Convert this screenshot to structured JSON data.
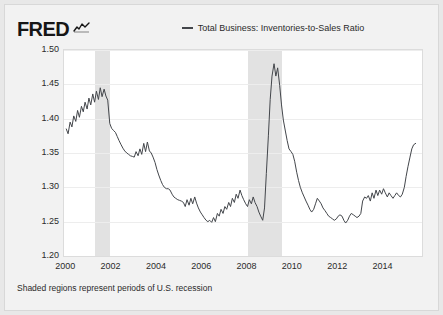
{
  "brand": {
    "wordmark": "FRED",
    "squiggle_icon": "fred-squiggle-icon"
  },
  "legend": {
    "position": "top-center",
    "entries": [
      {
        "label": "Total Business: Inventories-to-Sales Ratio",
        "color": "#43464b"
      }
    ]
  },
  "footnote": "Shaded regions represent periods of U.S. recession",
  "axes": {
    "y_title": "(Ratio)",
    "y_ticks": [
      "1.50",
      "1.45",
      "1.40",
      "1.35",
      "1.30",
      "1.25",
      "1.20"
    ],
    "x_ticks": [
      "2000",
      "2002",
      "2004",
      "2006",
      "2008",
      "2010",
      "2012",
      "2014"
    ]
  },
  "colors": {
    "series_line": "#43464b",
    "recession_band": "#e2e2e2",
    "plot_background": "#ffffff",
    "card_background": "#f2f2f2",
    "page_background": "#e8e8e8",
    "gridline": "#ededed",
    "text": "#2b2b2b"
  },
  "chart_data": {
    "type": "line",
    "title": "",
    "subtitle": "",
    "xlabel": "",
    "ylabel": "(Ratio)",
    "xlim": [
      1999.9,
      2015.7
    ],
    "ylim": [
      1.2,
      1.5
    ],
    "grid": true,
    "legend_position": "top-center",
    "x_tick_values": [
      2000,
      2002,
      2004,
      2006,
      2008,
      2010,
      2012,
      2014
    ],
    "y_tick_values": [
      1.2,
      1.25,
      1.3,
      1.35,
      1.4,
      1.45,
      1.5
    ],
    "annotations": [
      "Shaded regions represent periods of U.S. recession"
    ],
    "shaded_regions": [
      {
        "label": "2001 recession",
        "x_start": 2001.25,
        "x_end": 2001.92
      },
      {
        "label": "2007-2009 recession",
        "x_start": 2008.0,
        "x_end": 2009.5
      }
    ],
    "series": [
      {
        "name": "Total Business: Inventories-to-Sales Ratio",
        "color": "#43464b",
        "x": [
          2000.0,
          2000.08,
          2000.17,
          2000.25,
          2000.33,
          2000.42,
          2000.5,
          2000.58,
          2000.67,
          2000.75,
          2000.83,
          2000.92,
          2001.0,
          2001.08,
          2001.17,
          2001.25,
          2001.33,
          2001.42,
          2001.5,
          2001.58,
          2001.67,
          2001.75,
          2001.83,
          2001.92,
          2002.0,
          2002.08,
          2002.17,
          2002.25,
          2002.33,
          2002.42,
          2002.5,
          2002.58,
          2002.67,
          2002.75,
          2002.83,
          2002.92,
          2003.0,
          2003.08,
          2003.17,
          2003.25,
          2003.33,
          2003.42,
          2003.5,
          2003.58,
          2003.67,
          2003.75,
          2003.83,
          2003.92,
          2004.0,
          2004.08,
          2004.17,
          2004.25,
          2004.33,
          2004.42,
          2004.5,
          2004.58,
          2004.67,
          2004.75,
          2004.83,
          2004.92,
          2005.0,
          2005.08,
          2005.17,
          2005.25,
          2005.33,
          2005.42,
          2005.5,
          2005.58,
          2005.67,
          2005.75,
          2005.83,
          2005.92,
          2006.0,
          2006.08,
          2006.17,
          2006.25,
          2006.33,
          2006.42,
          2006.5,
          2006.58,
          2006.67,
          2006.75,
          2006.83,
          2006.92,
          2007.0,
          2007.08,
          2007.17,
          2007.25,
          2007.33,
          2007.42,
          2007.5,
          2007.58,
          2007.67,
          2007.75,
          2007.83,
          2007.92,
          2008.0,
          2008.08,
          2008.17,
          2008.25,
          2008.33,
          2008.42,
          2008.5,
          2008.58,
          2008.67,
          2008.75,
          2008.83,
          2008.92,
          2009.0,
          2009.08,
          2009.17,
          2009.25,
          2009.33,
          2009.42,
          2009.5,
          2009.58,
          2009.67,
          2009.75,
          2009.83,
          2009.92,
          2010.0,
          2010.08,
          2010.17,
          2010.25,
          2010.33,
          2010.42,
          2010.5,
          2010.58,
          2010.67,
          2010.75,
          2010.83,
          2010.92,
          2011.0,
          2011.08,
          2011.17,
          2011.25,
          2011.33,
          2011.42,
          2011.5,
          2011.58,
          2011.67,
          2011.75,
          2011.83,
          2011.92,
          2012.0,
          2012.08,
          2012.17,
          2012.25,
          2012.33,
          2012.42,
          2012.5,
          2012.58,
          2012.67,
          2012.75,
          2012.83,
          2012.92,
          2013.0,
          2013.08,
          2013.17,
          2013.25,
          2013.33,
          2013.42,
          2013.5,
          2013.58,
          2013.67,
          2013.75,
          2013.83,
          2013.92,
          2014.0,
          2014.08,
          2014.17,
          2014.25,
          2014.33,
          2014.42,
          2014.5,
          2014.58,
          2014.67,
          2014.75,
          2014.83,
          2014.92,
          2015.0,
          2015.08,
          2015.17,
          2015.25,
          2015.33,
          2015.42
        ],
        "values": [
          1.385,
          1.378,
          1.395,
          1.388,
          1.404,
          1.396,
          1.412,
          1.402,
          1.418,
          1.41,
          1.424,
          1.414,
          1.43,
          1.42,
          1.436,
          1.424,
          1.44,
          1.428,
          1.445,
          1.432,
          1.443,
          1.433,
          1.427,
          1.393,
          1.386,
          1.383,
          1.38,
          1.374,
          1.368,
          1.362,
          1.357,
          1.353,
          1.35,
          1.348,
          1.346,
          1.345,
          1.344,
          1.352,
          1.346,
          1.356,
          1.348,
          1.364,
          1.352,
          1.366,
          1.353,
          1.35,
          1.344,
          1.336,
          1.326,
          1.318,
          1.31,
          1.304,
          1.3,
          1.298,
          1.298,
          1.296,
          1.29,
          1.286,
          1.284,
          1.282,
          1.281,
          1.28,
          1.278,
          1.272,
          1.282,
          1.274,
          1.284,
          1.276,
          1.286,
          1.277,
          1.27,
          1.264,
          1.26,
          1.256,
          1.252,
          1.25,
          1.252,
          1.249,
          1.256,
          1.25,
          1.262,
          1.258,
          1.268,
          1.262,
          1.272,
          1.268,
          1.278,
          1.272,
          1.284,
          1.278,
          1.29,
          1.284,
          1.296,
          1.288,
          1.282,
          1.276,
          1.272,
          1.282,
          1.276,
          1.286,
          1.278,
          1.272,
          1.264,
          1.258,
          1.252,
          1.27,
          1.32,
          1.375,
          1.428,
          1.462,
          1.48,
          1.462,
          1.474,
          1.448,
          1.42,
          1.398,
          1.382,
          1.368,
          1.356,
          1.352,
          1.348,
          1.338,
          1.322,
          1.31,
          1.3,
          1.292,
          1.286,
          1.28,
          1.274,
          1.268,
          1.264,
          1.268,
          1.276,
          1.284,
          1.28,
          1.276,
          1.27,
          1.266,
          1.262,
          1.258,
          1.256,
          1.254,
          1.252,
          1.254,
          1.258,
          1.26,
          1.258,
          1.252,
          1.248,
          1.252,
          1.258,
          1.262,
          1.26,
          1.258,
          1.256,
          1.258,
          1.262,
          1.28,
          1.286,
          1.284,
          1.288,
          1.28,
          1.292,
          1.284,
          1.296,
          1.288,
          1.296,
          1.29,
          1.298,
          1.292,
          1.286,
          1.292,
          1.288,
          1.284,
          1.288,
          1.292,
          1.288,
          1.286,
          1.29,
          1.3,
          1.316,
          1.33,
          1.344,
          1.356,
          1.362,
          1.364
        ]
      }
    ]
  }
}
